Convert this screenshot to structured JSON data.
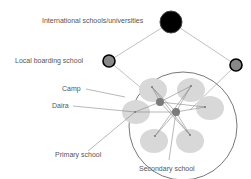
{
  "labels": {
    "international": "International schools/universities",
    "local_boarding": "Local boarding school",
    "camp": "Camp",
    "daira": "Daira",
    "primary": "Primary school",
    "secondary": "Secondary school"
  },
  "colors": {
    "international_node": "#000000",
    "boarding_node": "#888888",
    "daira_oval": "#d6d6d6",
    "secondary_node": "#777777",
    "line": "#aaaaaa",
    "camp_outline": "#555555"
  }
}
